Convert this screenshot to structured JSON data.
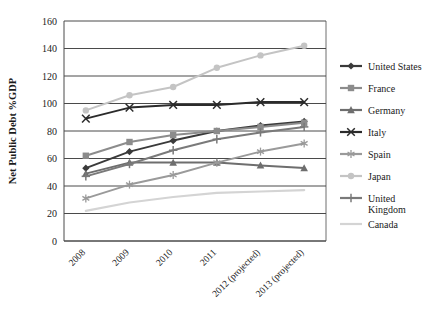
{
  "chart_data": {
    "type": "line",
    "title": "",
    "xlabel": "",
    "ylabel": "Net Public Debt %GDP",
    "ylim": [
      0,
      160
    ],
    "ytick_step": 20,
    "yticks": [
      "0",
      "20",
      "40",
      "60",
      "80",
      "100",
      "120",
      "140",
      "160"
    ],
    "grid": "horizontal",
    "legend_position": "right",
    "categories": [
      "2008",
      "2009",
      "2010",
      "2011",
      "2012 (projected)",
      "2013 (projected)"
    ],
    "series": [
      {
        "name": "United States",
        "marker": "diamond",
        "color": "#3a3a3a",
        "values": [
          53,
          65,
          73,
          80,
          84,
          87
        ]
      },
      {
        "name": "France",
        "marker": "square",
        "color": "#8c8c8c",
        "values": [
          62,
          72,
          77,
          80,
          83,
          86
        ]
      },
      {
        "name": "Germany",
        "marker": "triangle",
        "color": "#6e6e6e",
        "values": [
          49,
          57,
          57,
          57,
          55,
          53
        ]
      },
      {
        "name": "Italy",
        "marker": "x",
        "color": "#2b2b2b",
        "values": [
          89,
          97,
          99,
          99,
          101,
          101
        ]
      },
      {
        "name": "Spain",
        "marker": "asterisk",
        "color": "#9a9a9a",
        "values": [
          31,
          41,
          48,
          57,
          65,
          71
        ]
      },
      {
        "name": "Japan",
        "marker": "circle",
        "color": "#c4c4c4",
        "values": [
          95,
          106,
          112,
          126,
          135,
          142
        ]
      },
      {
        "name": "United Kingdom",
        "marker": "cross",
        "color": "#7a7a7a",
        "values": [
          47,
          56,
          66,
          74,
          79,
          83
        ]
      },
      {
        "name": "Canada",
        "marker": "none",
        "color": "#d4d4d4",
        "values": [
          22,
          28,
          32,
          35,
          36,
          37
        ]
      }
    ]
  },
  "legend": {
    "items": [
      {
        "label": "United States",
        "label2": "",
        "marker_name": "diamond-marker"
      },
      {
        "label": "France",
        "label2": "",
        "marker_name": "square-marker"
      },
      {
        "label": "Germany",
        "label2": "",
        "marker_name": "triangle-marker"
      },
      {
        "label": "Italy",
        "label2": "",
        "marker_name": "x-marker"
      },
      {
        "label": "Spain",
        "label2": "",
        "marker_name": "asterisk-marker"
      },
      {
        "label": "Japan",
        "label2": "",
        "marker_name": "circle-marker"
      },
      {
        "label": "United",
        "label2": "Kingdom",
        "marker_name": "cross-marker"
      },
      {
        "label": "Canada",
        "label2": "",
        "marker_name": "line-only-marker"
      }
    ]
  },
  "colors": {
    "background": "#ffffff",
    "gridline": "#4a4a4a",
    "axis": "#4a4a4a",
    "text": "#1a1a1a"
  }
}
